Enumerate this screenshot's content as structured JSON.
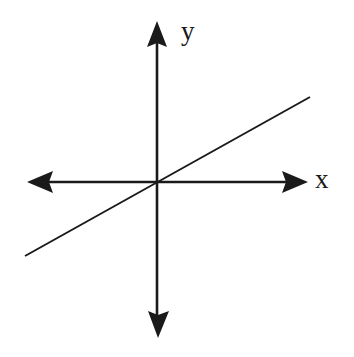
{
  "figure": {
    "background_color": "#ffffff",
    "stroke_color": "#1a1a1a",
    "width": 354,
    "height": 357
  },
  "labels": {
    "y_axis": "y",
    "x_axis": "x"
  },
  "chart_data": {
    "type": "line",
    "title": "",
    "xlabel": "x",
    "ylabel": "y",
    "grid": false,
    "legend": false,
    "axes": {
      "origin_px": [
        157,
        182
      ],
      "x_axis": {
        "label": "x",
        "from_px": [
          28,
          182
        ],
        "to_px": [
          307,
          182
        ],
        "arrowheads": [
          "start",
          "end"
        ],
        "direction": "horizontal"
      },
      "y_axis": {
        "label": "y",
        "from_px": [
          157,
          336
        ],
        "to_px": [
          157,
          23
        ],
        "arrowheads": [
          "start",
          "end"
        ],
        "direction": "vertical"
      }
    },
    "series": [
      {
        "name": "line-through-origin",
        "kind": "straight-line",
        "points_px": [
          [
            25,
            256
          ],
          [
            310,
            97
          ]
        ],
        "passes_through_origin": true,
        "slope_screen": -0.558,
        "slope_math": 0.558,
        "intercept": 0,
        "stroke_width": 2
      }
    ],
    "annotations": [
      {
        "text": "y",
        "position_px": [
          188,
          32
        ],
        "role": "y-axis-label"
      },
      {
        "text": "x",
        "position_px": [
          323,
          180
        ],
        "role": "x-axis-label"
      }
    ]
  }
}
